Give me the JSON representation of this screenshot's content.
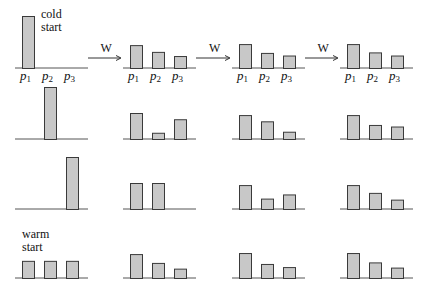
{
  "chart_data": {
    "type": "bar",
    "title": "",
    "categories": [
      "p1",
      "p2",
      "p3"
    ],
    "operator_label": "W",
    "annotations": {
      "cold_start": [
        "cold",
        "start"
      ],
      "warm_start": [
        "warm",
        "start"
      ]
    },
    "ylim": [
      0,
      1
    ],
    "rows": [
      {
        "name": "cold-start-p1",
        "annotation": "cold_start",
        "steps": [
          [
            1.0,
            0.0,
            0.0
          ],
          [
            0.44,
            0.31,
            0.23
          ],
          [
            0.46,
            0.29,
            0.24
          ],
          [
            0.46,
            0.3,
            0.24
          ]
        ]
      },
      {
        "name": "cold-start-p2",
        "annotation": "",
        "steps": [
          [
            0.0,
            1.0,
            0.0
          ],
          [
            0.5,
            0.12,
            0.38
          ],
          [
            0.46,
            0.34,
            0.14
          ],
          [
            0.46,
            0.27,
            0.24
          ]
        ]
      },
      {
        "name": "cold-start-p3",
        "annotation": "",
        "steps": [
          [
            0.0,
            0.0,
            1.0
          ],
          [
            0.5,
            0.5,
            0.0
          ],
          [
            0.46,
            0.2,
            0.28
          ],
          [
            0.46,
            0.31,
            0.18
          ]
        ]
      },
      {
        "name": "warm-start-uniform",
        "annotation": "warm_start",
        "steps": [
          [
            0.33,
            0.33,
            0.33
          ],
          [
            0.46,
            0.29,
            0.18
          ],
          [
            0.48,
            0.27,
            0.21
          ],
          [
            0.48,
            0.3,
            0.2
          ]
        ]
      }
    ],
    "labeled_row": 0
  }
}
